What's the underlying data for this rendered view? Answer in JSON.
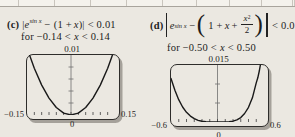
{
  "table_remnant": {
    "cells": [
      "",
      "",
      "",
      "",
      "",
      "",
      "",
      "",
      "",
      ""
    ]
  },
  "panel_c": {
    "label": "(c)",
    "abs_bar": "|",
    "func_base": "e",
    "func_exp": "sin x",
    "minus": "−",
    "poly_open": "(1 +",
    "var_x": "x",
    "poly_close": ")",
    "comparison": "< 0.01",
    "domain_pre": "for −0.14 <",
    "domain_var": "x",
    "domain_post": "< 0.14"
  },
  "panel_d": {
    "label": "(d)",
    "func_base": "e",
    "func_exp": "sin x",
    "minus": "−",
    "inner_pre": "1 +",
    "var_x": "x",
    "inner_plus": "+",
    "frac_num_base": "x",
    "frac_num_exp": "2",
    "frac_den": "2",
    "paren_open": "(",
    "paren_close": ")",
    "comparison": "< 0.01",
    "domain_pre": "for −0.50 <",
    "domain_var": "x",
    "domain_post": "< 0.50"
  },
  "chart_data": [
    {
      "type": "line",
      "panel": "(c)",
      "title": "|e^(sin x) − (1 + x)| graphed on viewing window [−0.15, 0.15] by [0, 0.01]",
      "xlim": [
        -0.15,
        0.15
      ],
      "ylim": [
        0,
        0.01
      ],
      "x_tick_divisions": 12,
      "y_tick_divisions": 5,
      "grid": false,
      "top_label": "0.01",
      "x_min_label": "−0.15",
      "x_max_label": "0.15",
      "origin_label": "0",
      "points": [
        [
          -0.15,
          0.01118
        ],
        [
          -0.125,
          0.00778
        ],
        [
          -0.1,
          0.00499
        ],
        [
          -0.075,
          0.00281
        ],
        [
          -0.05,
          0.00125
        ],
        [
          -0.025,
          0.00031
        ],
        [
          0,
          0
        ],
        [
          0.025,
          0.00031
        ],
        [
          0.05,
          0.00125
        ],
        [
          0.075,
          0.00281
        ],
        [
          0.1,
          0.00499
        ],
        [
          0.125,
          0.00778
        ],
        [
          0.15,
          0.01118
        ]
      ]
    },
    {
      "type": "line",
      "panel": "(d)",
      "title": "|e^(sin x) − (1 + x + x²/2)| graphed on viewing window [−0.6, 0.6] by [0, 0.015]",
      "xlim": [
        -0.6,
        0.6
      ],
      "ylim": [
        0,
        0.015
      ],
      "x_tick_divisions": 12,
      "y_tick_divisions": 3,
      "grid": false,
      "top_label": "0.015",
      "x_min_label": "−0.6",
      "x_max_label": "0.6",
      "origin_label": "0",
      "points": [
        [
          -0.6,
          0.01148
        ],
        [
          -0.55,
          0.00835
        ],
        [
          -0.5,
          0.00587
        ],
        [
          -0.45,
          0.00395
        ],
        [
          -0.4,
          0.00254
        ],
        [
          -0.35,
          0.00154
        ],
        [
          -0.3,
          0.00086
        ],
        [
          -0.25,
          0.00042
        ],
        [
          -0.2,
          0.00018
        ],
        [
          -0.15,
          6e-05
        ],
        [
          -0.1,
          1e-05
        ],
        [
          0,
          0
        ],
        [
          0.1,
          1e-05
        ],
        [
          0.15,
          7e-05
        ],
        [
          0.2,
          0.00022
        ],
        [
          0.25,
          0.00056
        ],
        [
          0.3,
          0.00117
        ],
        [
          0.35,
          0.00223
        ],
        [
          0.4,
          0.00388
        ],
        [
          0.45,
          0.00636
        ],
        [
          0.5,
          0.01038
        ],
        [
          0.52,
          0.01163
        ],
        [
          0.54,
          0.01355
        ],
        [
          0.56,
          0.0158
        ]
      ]
    }
  ]
}
